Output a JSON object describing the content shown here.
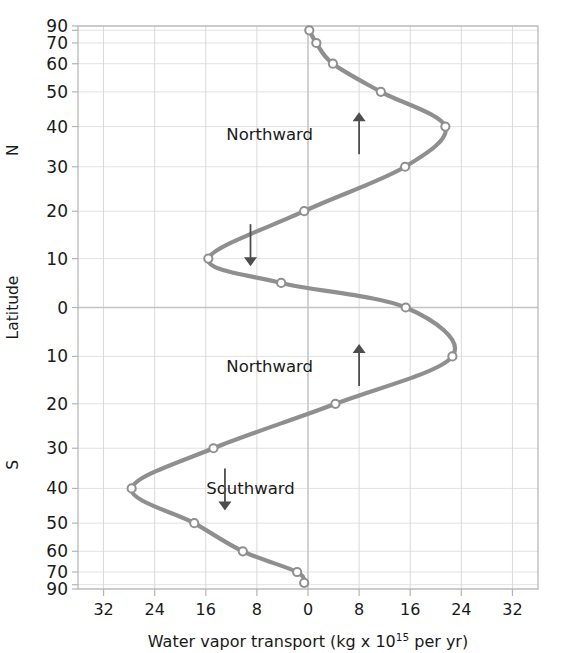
{
  "chart_data": {
    "type": "line",
    "title": "",
    "xlabel": "Water vapor transport (kg x 10^15 per yr)",
    "ylabel": "Latitude",
    "xlabel_parts": {
      "pre": "Water vapor transport (kg x 10",
      "exponent": "15",
      "post": " per yr)"
    },
    "xlim": [
      -36,
      36
    ],
    "ylim": [
      -90,
      90
    ],
    "y_scale": "sine-latitude",
    "grid": true,
    "legend": null,
    "x_ticks": [
      -32,
      -24,
      -16,
      -8,
      0,
      8,
      16,
      24,
      32
    ],
    "x_tick_labels": [
      "32",
      "24",
      "16",
      "8",
      "0",
      "8",
      "16",
      "24",
      "32"
    ],
    "y_ticks": [
      90,
      80,
      70,
      60,
      50,
      40,
      30,
      20,
      10,
      0,
      -10,
      -20,
      -30,
      -40,
      -50,
      -60,
      -70,
      -80,
      -90
    ],
    "y_tick_labels": [
      "90",
      "",
      "70",
      "60",
      "50",
      "40",
      "30",
      "20",
      "10",
      "0",
      "10",
      "20",
      "30",
      "40",
      "50",
      "60",
      "70",
      "",
      "90"
    ],
    "hemisphere_labels": {
      "north": "N",
      "south": "S"
    },
    "series": [
      {
        "name": "Water vapor transport",
        "color": "#8f8f8f",
        "marker": "open-circle",
        "points": [
          {
            "lat": 80,
            "value": 0.2
          },
          {
            "lat": 70,
            "value": 1.3
          },
          {
            "lat": 60,
            "value": 3.9
          },
          {
            "lat": 50,
            "value": 11.4
          },
          {
            "lat": 40,
            "value": 21.5
          },
          {
            "lat": 30,
            "value": 15.2
          },
          {
            "lat": 20,
            "value": -0.6
          },
          {
            "lat": 10,
            "value": -15.6
          },
          {
            "lat": 5,
            "value": -4.2
          },
          {
            "lat": 0,
            "value": 15.3
          },
          {
            "lat": -10,
            "value": 22.6
          },
          {
            "lat": -20,
            "value": 4.3
          },
          {
            "lat": -30,
            "value": -14.8
          },
          {
            "lat": -40,
            "value": -27.6
          },
          {
            "lat": -50,
            "value": -17.8
          },
          {
            "lat": -60,
            "value": -10.2
          },
          {
            "lat": -70,
            "value": -1.7
          },
          {
            "lat": -78,
            "value": -0.6
          }
        ]
      }
    ],
    "annotations": [
      {
        "id": "north-upper",
        "text": "Northward",
        "direction": "up",
        "lat": 38,
        "x_text": -6,
        "x_arrow": 8
      },
      {
        "id": "south-upper",
        "text": "",
        "direction": "down",
        "lat": 13,
        "x_text": -9,
        "x_arrow": -9
      },
      {
        "id": "north-lower",
        "text": "Northward",
        "direction": "up",
        "lat": -12,
        "x_text": -6,
        "x_arrow": 8
      },
      {
        "id": "south-lower",
        "text": "Southward",
        "direction": "down",
        "lat": -40,
        "x_text": -9,
        "x_arrow": -13
      }
    ],
    "colors": {
      "curve": "#8f8f8f",
      "marker_fill": "#ffffff",
      "marker_stroke": "#8f8f8f",
      "grid": "#d9d9d9",
      "axis": "#b4b4b4",
      "zero_line": "#c4c4c4",
      "text": "#1a1a1a",
      "annotation": "#4d4d4d"
    }
  }
}
